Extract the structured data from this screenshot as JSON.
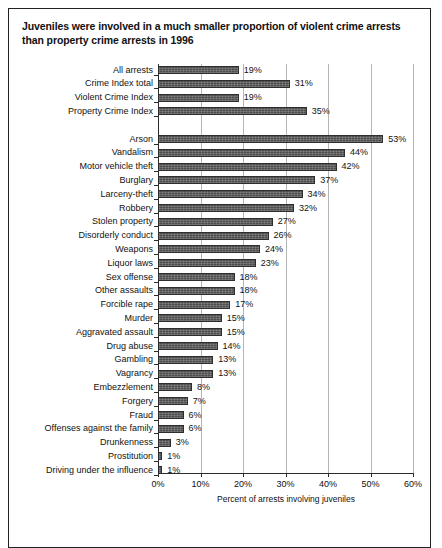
{
  "title": "Juveniles were involved in a much smaller proportion of violent crime arrests than property crime arrests in 1996",
  "axis": {
    "xlabel": "Percent of arrests involving juveniles",
    "ticks": [
      "0%",
      "10%",
      "20%",
      "30%",
      "40%",
      "50%",
      "60%"
    ]
  },
  "chart_data": {
    "type": "bar",
    "orientation": "horizontal",
    "title": "Juveniles were involved in a much smaller proportion of violent crime arrests than property crime arrests in 1996",
    "xlabel": "Percent of arrests involving juveniles",
    "ylabel": "",
    "xlim": [
      0,
      60
    ],
    "xticks": [
      0,
      10,
      20,
      30,
      40,
      50,
      60
    ],
    "xtick_labels": [
      "0%",
      "10%",
      "20%",
      "30%",
      "40%",
      "50%",
      "60%"
    ],
    "grid": true,
    "legend": "none",
    "bar_color": "#4d4d4d",
    "value_suffix": "%",
    "groups": [
      {
        "name": "summary",
        "categories": [
          "All arrests",
          "Crime Index total",
          "Violent Crime Index",
          "Property Crime Index"
        ],
        "values": [
          19,
          31,
          19,
          35
        ],
        "labels": [
          "19%",
          "31%",
          "19%",
          "35%"
        ]
      },
      {
        "name": "offenses",
        "categories": [
          "Arson",
          "Vandalism",
          "Motor vehicle theft",
          "Burglary",
          "Larceny-theft",
          "Robbery",
          "Stolen property",
          "Disorderly conduct",
          "Weapons",
          "Liquor laws",
          "Sex offense",
          "Other assaults",
          "Forcible rape",
          "Murder",
          "Aggravated assault",
          "Drug abuse",
          "Gambling",
          "Vagrancy",
          "Embezzlement",
          "Forgery",
          "Fraud",
          "Offenses against the family",
          "Drunkenness",
          "Prostitution",
          "Driving under the influence"
        ],
        "values": [
          53,
          44,
          42,
          37,
          34,
          32,
          27,
          26,
          24,
          23,
          18,
          18,
          17,
          15,
          15,
          14,
          13,
          13,
          8,
          7,
          6,
          6,
          3,
          1,
          1
        ],
        "labels": [
          "53%",
          "44%",
          "42%",
          "37%",
          "34%",
          "32%",
          "27%",
          "26%",
          "24%",
          "23%",
          "18%",
          "18%",
          "17%",
          "15%",
          "15%",
          "14%",
          "13%",
          "13%",
          "8%",
          "7%",
          "6%",
          "6%",
          "3%",
          "1%",
          "1%"
        ]
      }
    ],
    "categories": [
      "All arrests",
      "Crime Index total",
      "Violent Crime Index",
      "Property Crime Index",
      "Arson",
      "Vandalism",
      "Motor vehicle theft",
      "Burglary",
      "Larceny-theft",
      "Robbery",
      "Stolen property",
      "Disorderly conduct",
      "Weapons",
      "Liquor laws",
      "Sex offense",
      "Other assaults",
      "Forcible rape",
      "Murder",
      "Aggravated assault",
      "Drug abuse",
      "Gambling",
      "Vagrancy",
      "Embezzlement",
      "Forgery",
      "Fraud",
      "Offenses against the family",
      "Drunkenness",
      "Prostitution",
      "Driving under the influence"
    ],
    "values": [
      19,
      31,
      19,
      35,
      53,
      44,
      42,
      37,
      34,
      32,
      27,
      26,
      24,
      23,
      18,
      18,
      17,
      15,
      15,
      14,
      13,
      13,
      8,
      7,
      6,
      6,
      3,
      1,
      1
    ]
  }
}
